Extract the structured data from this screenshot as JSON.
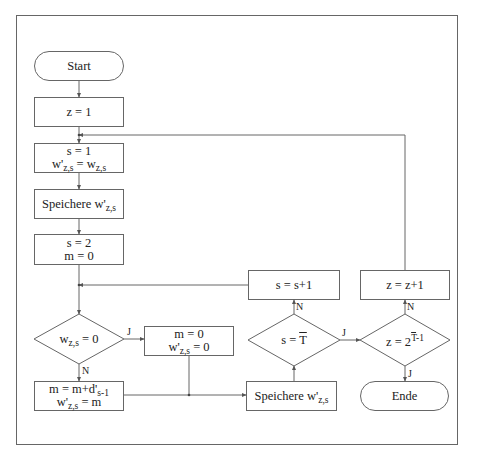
{
  "diagram": {
    "type": "flowchart",
    "colors": {
      "stroke": "#666666",
      "text": "#222222",
      "background": "#ffffff"
    },
    "nodes": {
      "start": {
        "shape": "terminal",
        "label": "Start"
      },
      "init_z": {
        "shape": "process",
        "label": "z = 1"
      },
      "init_s": {
        "shape": "process",
        "line1": "s = 1",
        "line2_pre": "w'",
        "line2_sub": "z,s",
        "line2_mid": " = w",
        "line2_sub2": "z,s"
      },
      "store1": {
        "shape": "process",
        "pre": "Speichere w'",
        "sub": "z,s"
      },
      "init_m": {
        "shape": "process",
        "line1": "s = 2",
        "line2": "m = 0"
      },
      "dec_w": {
        "shape": "decision",
        "pre": "w",
        "sub": "z,s",
        "post": " = 0"
      },
      "reset_m": {
        "shape": "process",
        "line1": "m = 0",
        "line2_pre": "w'",
        "line2_sub": "z,s",
        "line2_post": " = 0"
      },
      "accum_m": {
        "shape": "process",
        "line1_pre": "m = m+d'",
        "line1_sub": "s-1",
        "line2_pre": "w'",
        "line2_sub": "z,s",
        "line2_post": " = m"
      },
      "store2": {
        "shape": "process",
        "pre": "Speichere w'",
        "sub": "z,s"
      },
      "dec_s": {
        "shape": "decision",
        "pre": "s = ",
        "over": "T"
      },
      "inc_s": {
        "shape": "process",
        "label": "s = s+1"
      },
      "dec_z": {
        "shape": "decision",
        "pre": "z = 2",
        "sup_over": "T",
        "sup_post": "-1"
      },
      "inc_z": {
        "shape": "process",
        "label": "z = z+1"
      },
      "end": {
        "shape": "terminal",
        "label": "Ende"
      }
    },
    "edge_labels": {
      "dec_w_yes": "J",
      "dec_w_no": "N",
      "dec_s_yes": "J",
      "dec_s_no": "N",
      "dec_z_yes": "J",
      "dec_z_no": "N"
    }
  }
}
